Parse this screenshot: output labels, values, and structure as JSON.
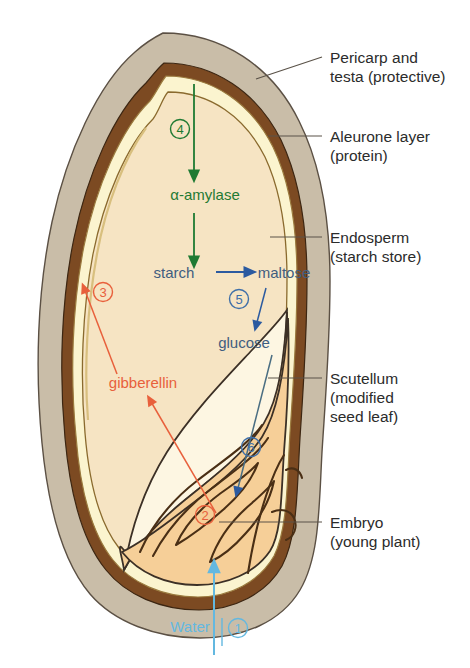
{
  "diagram": {
    "background_color": "#ffffff"
  },
  "colors": {
    "pericarp_fill": "#c9bda8",
    "testa_fill": "#7c4a22",
    "aleurone_fill": "#fbf4cf",
    "endosperm_fill": "#f6e4c3",
    "scutellum_fill": "#fdf6e2",
    "embryo_fill": "#f6cf98",
    "outline": "#3c3026",
    "green": "#1f7a33",
    "blue": "#3f5d80",
    "arrow_blue": "#2b5aa0",
    "red": "#e8603c",
    "water_blue": "#63b8e0",
    "label_text": "#2b2b2b",
    "leader_line": "#5a5248"
  },
  "callouts": [
    {
      "id": "pericarp",
      "lines": [
        "Pericarp and",
        "testa (protective)"
      ],
      "x": 330,
      "y": 58
    },
    {
      "id": "aleurone",
      "lines": [
        "Aleurone layer",
        "(protein)"
      ],
      "x": 330,
      "y": 132
    },
    {
      "id": "endosperm",
      "lines": [
        "Endosperm",
        "(starch store)"
      ],
      "x": 330,
      "y": 230
    },
    {
      "id": "scutellum",
      "lines": [
        "Scutellum",
        "(modified",
        "seed leaf)"
      ],
      "x": 330,
      "y": 370
    },
    {
      "id": "embryo",
      "lines": [
        "Embryo",
        "(young plant)"
      ],
      "x": 330,
      "y": 515
    }
  ],
  "inner_labels": [
    {
      "id": "alpha-amylase",
      "text": "α-amylase",
      "color_key": "green",
      "x": 205,
      "y": 200
    },
    {
      "id": "starch",
      "text": "starch",
      "color_key": "blue",
      "x": 174,
      "y": 278
    },
    {
      "id": "maltose",
      "text": "maltose",
      "color_key": "blue",
      "x": 262,
      "y": 278
    },
    {
      "id": "glucose",
      "text": "glucose",
      "color_key": "blue",
      "x": 244,
      "y": 348
    },
    {
      "id": "gibberellin",
      "text": "gibberellin",
      "color_key": "red",
      "x": 143,
      "y": 388
    },
    {
      "id": "water",
      "text": "Water",
      "color_key": "water_blue",
      "x": 190,
      "y": 632
    }
  ],
  "step_numbers": [
    {
      "id": "step-1",
      "label": "1",
      "color_key": "water_blue",
      "x": 238,
      "y": 632,
      "meaning": "Water uptake by embryo"
    },
    {
      "id": "step-2",
      "label": "2",
      "color_key": "red",
      "x": 205,
      "y": 519,
      "meaning": "Embryo releases gibberellin"
    },
    {
      "id": "step-3",
      "label": "3",
      "color_key": "red",
      "x": 103,
      "y": 296,
      "meaning": "Gibberellin reaches aleurone layer"
    },
    {
      "id": "step-4",
      "label": "4",
      "color_key": "green",
      "x": 180,
      "y": 133,
      "meaning": "Aleurone produces α-amylase"
    },
    {
      "id": "step-5",
      "label": "5",
      "color_key": "blue",
      "x": 239,
      "y": 303,
      "meaning": "Maltose converted to glucose"
    },
    {
      "id": "step-6",
      "label": "6",
      "color_key": "blue",
      "x": 251,
      "y": 451,
      "meaning": "Glucose transported to embryo"
    }
  ],
  "flow_arrows": [
    {
      "id": "arrow-amylase-down-top",
      "color_key": "green",
      "from": "aleurone layer",
      "to": "α-amylase"
    },
    {
      "id": "arrow-amylase-down-bottom",
      "color_key": "green",
      "from": "α-amylase",
      "to": "starch"
    },
    {
      "id": "arrow-starch-to-maltose",
      "color_key": "arrow_blue",
      "from": "starch",
      "to": "maltose"
    },
    {
      "id": "arrow-maltose-to-glucose",
      "color_key": "arrow_blue",
      "from": "maltose",
      "to": "glucose"
    },
    {
      "id": "arrow-glucose-to-embryo",
      "color_key": "arrow_blue",
      "from": "glucose",
      "to": "embryo"
    },
    {
      "id": "arrow-gibberellin-up",
      "color_key": "red",
      "from": "embryo",
      "to": "gibberellin"
    },
    {
      "id": "arrow-gibberellin-aleurone",
      "color_key": "red",
      "from": "gibberellin",
      "to": "aleurone layer"
    },
    {
      "id": "arrow-water-in",
      "color_key": "water_blue",
      "from": "outside",
      "to": "embryo"
    }
  ]
}
